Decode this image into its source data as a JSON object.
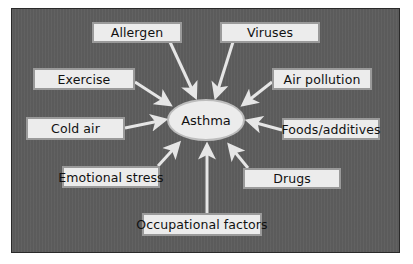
{
  "diagram": {
    "center": {
      "label": "Asthma"
    },
    "triggers": [
      {
        "id": "allergen",
        "label": "Allergen"
      },
      {
        "id": "viruses",
        "label": "Viruses"
      },
      {
        "id": "exercise",
        "label": "Exercise"
      },
      {
        "id": "air-pollution",
        "label": "Air pollution"
      },
      {
        "id": "cold-air",
        "label": "Cold air"
      },
      {
        "id": "foods-additives",
        "label": "Foods/additives"
      },
      {
        "id": "emotional-stress",
        "label": "Emotional stress"
      },
      {
        "id": "drugs",
        "label": "Drugs"
      },
      {
        "id": "occupational-factors",
        "label": "Occupational factors"
      }
    ],
    "colors": {
      "panel": "#5e5e5e",
      "box": "#ececec",
      "arrow": "#e8e8e8"
    }
  }
}
